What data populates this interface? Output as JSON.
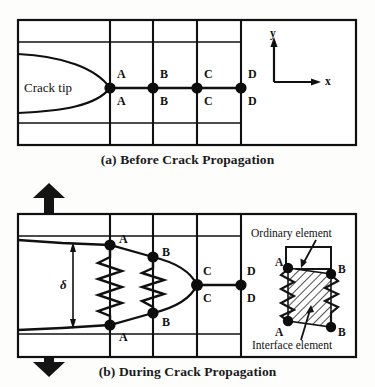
{
  "figure": {
    "title_a": "(a) Before Crack Propagation",
    "title_b": "(b) During Crack Propagation",
    "line_color": "#101010",
    "node_color": "#0d0d0d",
    "background": "#fdfdfc"
  },
  "panel_a": {
    "caption": "(a) Before Crack Propagation",
    "crack_tip_label": "Crack tip",
    "axes": {
      "y_label": "y",
      "x_label": "x"
    },
    "nodes": [
      {
        "label": "A",
        "x": 110,
        "y": 88
      },
      {
        "label": "B",
        "x": 153,
        "y": 88
      },
      {
        "label": "C",
        "x": 197,
        "y": 88
      },
      {
        "label": "D",
        "x": 241,
        "y": 88
      }
    ],
    "upper_labels": [
      "A",
      "B",
      "C",
      "D"
    ],
    "lower_labels": [
      "A",
      "B",
      "C",
      "D"
    ]
  },
  "panel_b": {
    "caption": "(b) During Crack Propagation",
    "opening_symbol": "δ",
    "load_arrows": [
      "up",
      "down"
    ],
    "nodes_upper": [
      {
        "label": "A",
        "x": 110,
        "y": 245
      },
      {
        "label": "B",
        "x": 153,
        "y": 257
      },
      {
        "label": "C",
        "x": 197,
        "y": 285
      },
      {
        "label": "D",
        "x": 241,
        "y": 285
      }
    ],
    "nodes_lower": [
      {
        "label": "A",
        "x": 110,
        "y": 325
      },
      {
        "label": "B",
        "x": 153,
        "y": 313
      },
      {
        "label": "C",
        "x": 197,
        "y": 285
      },
      {
        "label": "D",
        "x": 241,
        "y": 285
      }
    ],
    "springs": [
      {
        "name": "spring-A",
        "x": 110
      },
      {
        "name": "spring-B",
        "x": 153
      }
    ],
    "inset": {
      "ordinary_element_label": "Ordinary element",
      "interface_element_label": "Interface element",
      "corner_labels": {
        "top_left": "A",
        "top_right": "B",
        "bottom_left": "A",
        "bottom_right": "B"
      }
    }
  }
}
